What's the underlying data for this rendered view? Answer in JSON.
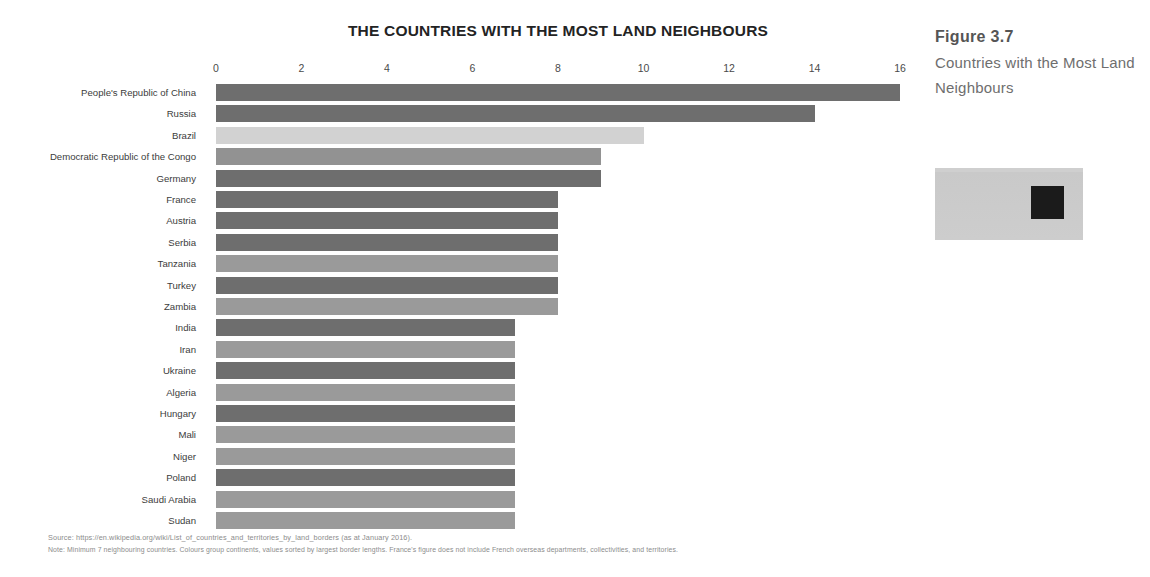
{
  "chart_data": {
    "type": "bar",
    "orientation": "horizontal",
    "title": "THE COUNTRIES WITH THE MOST LAND NEIGHBOURS",
    "xlabel": "",
    "ylabel": "",
    "xlim": [
      0,
      16
    ],
    "xticks": [
      0,
      2,
      4,
      6,
      8,
      10,
      12,
      14,
      16
    ],
    "grid": false,
    "legend": "none",
    "categories": [
      "People's Republic of China",
      "Russia",
      "Brazil",
      "Democratic Republic of the Congo",
      "Germany",
      "France",
      "Austria",
      "Serbia",
      "Tanzania",
      "Turkey",
      "Zambia",
      "India",
      "Iran",
      "Ukraine",
      "Algeria",
      "Hungary",
      "Mali",
      "Niger",
      "Poland",
      "Saudi Arabia",
      "Sudan"
    ],
    "values": [
      16,
      14,
      10,
      9,
      9,
      8,
      8,
      8,
      8,
      8,
      8,
      7,
      7,
      7,
      7,
      7,
      7,
      7,
      7,
      7,
      7
    ],
    "colors": [
      "#6e6e6e",
      "#6e6e6e",
      "#d2d2d2",
      "#929292",
      "#6e6e6e",
      "#6e6e6e",
      "#6e6e6e",
      "#6e6e6e",
      "#9a9a9a",
      "#6e6e6e",
      "#9a9a9a",
      "#6e6e6e",
      "#9a9a9a",
      "#6e6e6e",
      "#9a9a9a",
      "#6e6e6e",
      "#9a9a9a",
      "#9a9a9a",
      "#6e6e6e",
      "#9a9a9a",
      "#9a9a9a"
    ]
  },
  "notes": {
    "source": "Source: https://en.wikipedia.org/wiki/List_of_countries_and_territories_by_land_borders  (as at January 2016).",
    "note": "Note: Minimum 7 neighbouring countries. Colours group continents, values sorted by largest border lengths. France's figure does not include French overseas departments, collectivities, and territories."
  },
  "caption": {
    "figure_number": "Figure 3.7",
    "figure_title": "Countries with the Most Land Neighbours"
  },
  "thumbnail": {
    "kind": "qr-code-thumbnail"
  }
}
